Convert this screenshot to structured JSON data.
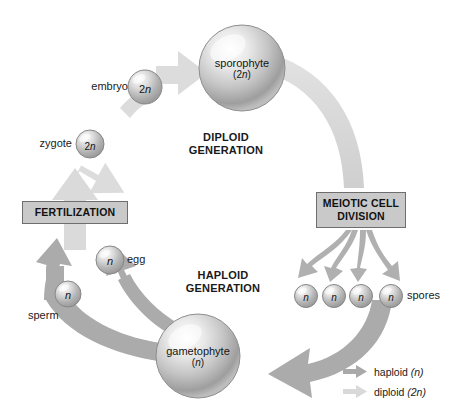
{
  "diagram": {
    "background": "#ffffff",
    "colors": {
      "haploid_arrow": "#a9a9a9",
      "diploid_arrow": "#d9d9d9",
      "box_fill": "#c9c9c9",
      "box_border": "#6e6e6e",
      "text": "#1a1a1a"
    }
  },
  "generation_labels": {
    "diploid": "DIPLOID\nGENERATION",
    "haploid": "HAPLOID\nGENERATION"
  },
  "process_boxes": [
    {
      "id": "fertilization",
      "label": "FERTILIZATION"
    },
    {
      "id": "meiotic-cell-division",
      "label": "MEIOTIC CELL\nDIVISION"
    }
  ],
  "structures": [
    {
      "id": "sporophyte",
      "name": "sporophyte",
      "ploidy": "2n",
      "label_position": "inside",
      "ploidy_italic_part": "n"
    },
    {
      "id": "gametophyte",
      "name": "gametophyte",
      "ploidy": "n",
      "label_position": "inside",
      "ploidy_italic_part": "n"
    },
    {
      "id": "embryo",
      "name": "embryo",
      "ploidy": "2n",
      "label_position": "left"
    },
    {
      "id": "zygote",
      "name": "zygote",
      "ploidy": "2n",
      "label_position": "left"
    },
    {
      "id": "egg",
      "name": "egg",
      "ploidy": "n",
      "label_position": "right"
    },
    {
      "id": "sperm",
      "name": "sperm",
      "ploidy": "n",
      "label_position": "below-left"
    },
    {
      "id": "spores",
      "name": "spores",
      "ploidy": "n",
      "label_position": "right",
      "count": 4
    }
  ],
  "spore_markers": [
    "n",
    "n",
    "n",
    "n"
  ],
  "legend": {
    "items": [
      {
        "id": "haploid",
        "label": "haploid (n)",
        "text_plain": "haploid ",
        "text_italic": "(n)",
        "color": "#a9a9a9"
      },
      {
        "id": "diploid",
        "label": "diploid (2n)",
        "text_plain": "diploid ",
        "text_italic": "(2n)",
        "color": "#d9d9d9"
      }
    ]
  },
  "flow": {
    "diploid_steps": [
      "zygote",
      "embryo",
      "sporophyte"
    ],
    "haploid_steps": [
      "spores",
      "gametophyte",
      "egg",
      "sperm"
    ],
    "cycle": "fertilization → zygote → embryo → sporophyte → meiotic cell division → spores → gametophyte → egg/sperm → fertilization"
  }
}
